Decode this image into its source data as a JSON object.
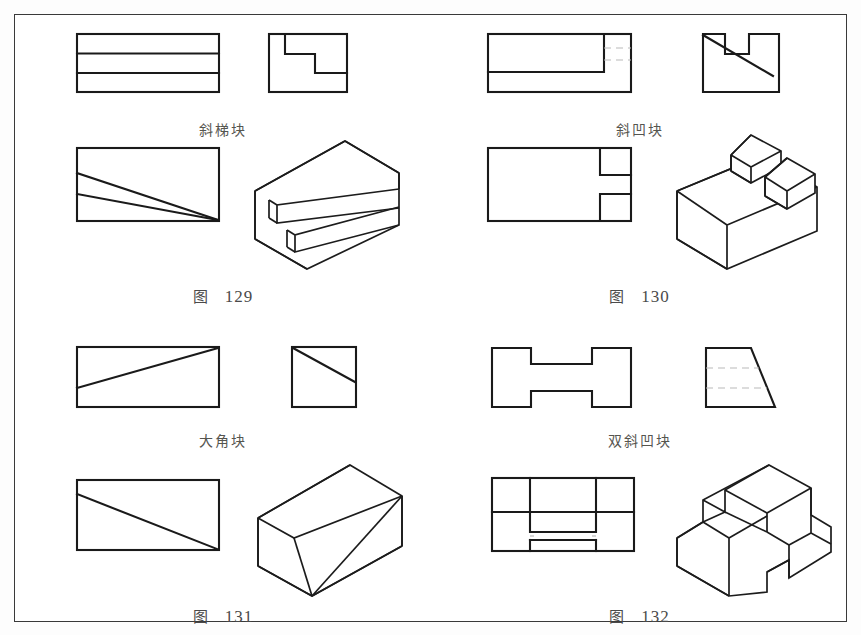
{
  "page": {
    "width": 861,
    "height": 635,
    "background_color": "#ffffff",
    "border_color": "#3a3a3a",
    "line_color": "#1a1a1a",
    "hidden_line_color": "#b9b9b9",
    "text_color": "#4a4a4a",
    "document_type": "technical-drawing-exercise-plate"
  },
  "figures": [
    {
      "id": "fig-129",
      "name_label": "斜梯块",
      "caption_cjk": "图",
      "caption_number": "129",
      "position": "top-left",
      "views": [
        "top-view-three-bands",
        "side-view-stepped-profile",
        "front-view-converging-lines",
        "isometric-stepped-wedge"
      ]
    },
    {
      "id": "fig-130",
      "name_label": "斜凹块",
      "caption_cjk": "图",
      "caption_number": "130",
      "position": "top-right",
      "views": [
        "top-view-with-hidden-lines",
        "side-view-notched-slope",
        "front-view-two-slots",
        "isometric-sloped-block-with-bosses"
      ]
    },
    {
      "id": "fig-131",
      "name_label": "大角块",
      "caption_cjk": "图",
      "caption_number": "131",
      "position": "bottom-left",
      "views": [
        "top-view-diagonal",
        "side-view-diagonal",
        "front-view-diagonal",
        "isometric-corner-cut-block"
      ]
    },
    {
      "id": "fig-132",
      "name_label": "双斜凹块",
      "caption_cjk": "图",
      "caption_number": "132",
      "position": "bottom-right",
      "views": [
        "top-view-h-shape",
        "side-view-trapezoid-hidden-lines",
        "front-view-stepped-h",
        "isometric-double-bevel-channel-block"
      ]
    }
  ]
}
